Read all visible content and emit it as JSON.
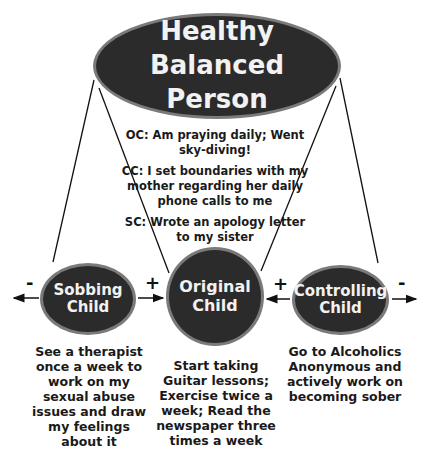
{
  "diagram": {
    "top_node": {
      "label": "Healthy Balanced Person"
    },
    "notes": [
      {
        "text": "OC: Am praying daily; Went sky-diving!"
      },
      {
        "text": "CC: I set boundaries with my mother regarding her daily phone calls to me"
      },
      {
        "text": "SC: Wrote an apology letter to my sister"
      }
    ],
    "children": [
      {
        "id": "sobbing",
        "label": "Sobbing Child",
        "outer_sign": "-",
        "inner_sign": "+",
        "caption": "See a therapist once a week to work on my sexual abuse issues and draw my feelings about it"
      },
      {
        "id": "original",
        "label": "Original Child",
        "caption": "Start taking Guitar lessons; Exercise twice a week; Read the newspaper three times a week"
      },
      {
        "id": "controlling",
        "label": "Controlling Child",
        "outer_sign": "-",
        "inner_sign": "+",
        "caption": "Go to Alcoholics Anonymous and actively work on becoming sober"
      }
    ],
    "colors": {
      "node_fill": "#2b2b2b",
      "node_border": "#7a7a7a",
      "node_text": "#f2f2f2",
      "line": "#111111"
    }
  }
}
